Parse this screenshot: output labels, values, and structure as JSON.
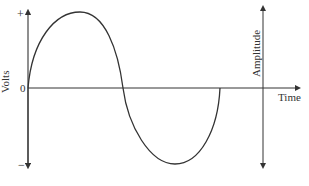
{
  "diagram": {
    "y_axis": {
      "label": "Volts",
      "top_tick": "+",
      "zero_tick": "0",
      "bottom_tick": "−"
    },
    "x_axis": {
      "label": "Time"
    },
    "amplitude_marker": {
      "label": "Amplitude"
    },
    "colors": {
      "line": "#333333",
      "background": "#ffffff"
    }
  }
}
